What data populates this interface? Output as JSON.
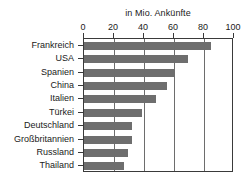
{
  "chart_data": {
    "type": "bar",
    "orientation": "horizontal",
    "title": "in Mio. Ankünfte",
    "subtitle": "",
    "xlabel": "",
    "ylabel": "",
    "categories": [
      "Frankreich",
      "USA",
      "Spanien",
      "China",
      "Italien",
      "Türkei",
      "Deutschland",
      "Großbritannien",
      "Russland",
      "Thailand"
    ],
    "values": [
      84.5,
      69.5,
      60.5,
      55.0,
      48.0,
      38.5,
      32.0,
      32.0,
      29.0,
      26.5
    ],
    "xlim": [
      0,
      100
    ],
    "ylim": null,
    "xticks": [
      0,
      20,
      40,
      60,
      80,
      100
    ],
    "xtick_labels": [
      "0",
      "20",
      "40",
      "60",
      "80",
      "100"
    ],
    "grid": "vertical",
    "gridline_values": [
      20,
      40,
      60,
      80
    ],
    "legend": null,
    "legend_position": "none",
    "axis_position": "top",
    "colors": {
      "bar": "#6e6e6e",
      "frame": "#3a3a3a",
      "gridline": "#6d6d6d",
      "text": "#1a1a1a",
      "background": "#ffffff"
    }
  }
}
